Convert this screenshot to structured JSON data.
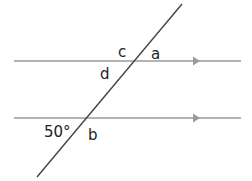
{
  "diagram": {
    "type": "parallel lines cut by a transversal",
    "parallel_lines": [
      {
        "y": 61,
        "x1": 14,
        "x2": 241,
        "color": "#9a9a9a",
        "arrow_x": 196
      },
      {
        "y": 118,
        "x1": 14,
        "x2": 241,
        "color": "#9a9a9a",
        "arrow_x": 196
      }
    ],
    "transversal": {
      "x1": 182,
      "y1": 4,
      "x2": 37,
      "y2": 177,
      "color": "#444444"
    },
    "labels": {
      "c": "c",
      "a": "a",
      "d": "d",
      "b": "b",
      "given_angle": "50°"
    }
  }
}
